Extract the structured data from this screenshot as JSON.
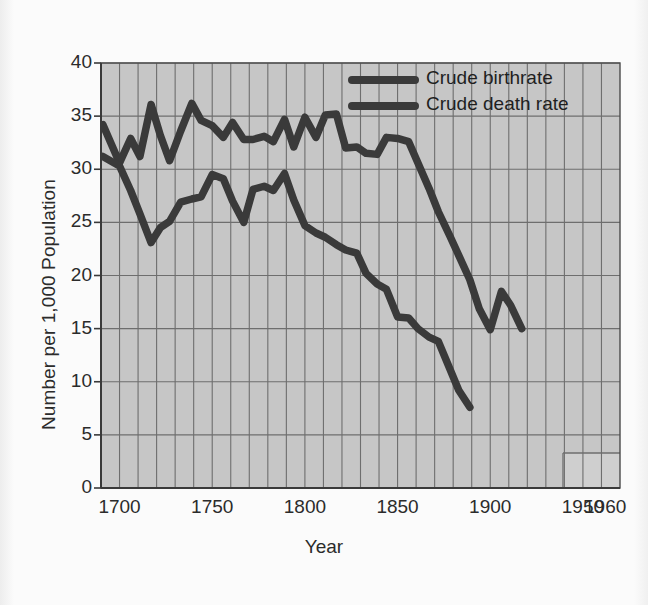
{
  "figure": {
    "background_color": "#fbfbfb",
    "plot_background_color": "#c6c6c6",
    "grid_color": "#6e6e6e",
    "line_color": "#3a3a3a"
  },
  "axes": {
    "y_title": "Number per 1,000 Population",
    "x_title": "Year",
    "y_ticks": [
      "40",
      "35",
      "30",
      "25",
      "20",
      "15",
      "10",
      "5",
      "0"
    ],
    "x_ticks": [
      "1700",
      "1750",
      "1800",
      "1850",
      "1900",
      "1950",
      "1960"
    ]
  },
  "legend": {
    "items": [
      {
        "label": "Crude birthrate",
        "color": "#3a3a3a"
      },
      {
        "label": "Crude death rate",
        "color": "#3a3a3a"
      }
    ]
  },
  "chart_data": {
    "type": "line",
    "title": "",
    "xlabel": "Year",
    "ylabel": "Number per 1,000 Population",
    "xlim": [
      1690,
      1970
    ],
    "ylim": [
      0,
      40
    ],
    "grid": true,
    "legend_position": "top-right",
    "series": [
      {
        "name": "Crude birthrate",
        "color": "#3a3a3a",
        "points": [
          [
            1691,
            34.2
          ],
          [
            1700,
            30.6
          ],
          [
            1706,
            32.9
          ],
          [
            1711,
            31.2
          ],
          [
            1717,
            36.1
          ],
          [
            1722,
            33.2
          ],
          [
            1727,
            30.8
          ],
          [
            1733,
            33.6
          ],
          [
            1739,
            36.2
          ],
          [
            1744,
            34.6
          ],
          [
            1750,
            34.1
          ],
          [
            1756,
            33.0
          ],
          [
            1761,
            34.4
          ],
          [
            1767,
            32.8
          ],
          [
            1772,
            32.8
          ],
          [
            1778,
            33.1
          ],
          [
            1783,
            32.6
          ],
          [
            1789,
            34.7
          ],
          [
            1794,
            32.1
          ],
          [
            1800,
            34.9
          ],
          [
            1806,
            33.0
          ],
          [
            1811,
            35.1
          ],
          [
            1817,
            35.2
          ],
          [
            1822,
            32.0
          ],
          [
            1828,
            32.1
          ],
          [
            1833,
            31.5
          ],
          [
            1839,
            31.4
          ],
          [
            1844,
            33.0
          ],
          [
            1850,
            32.9
          ],
          [
            1856,
            32.6
          ],
          [
            1861,
            30.6
          ],
          [
            1867,
            28.2
          ],
          [
            1872,
            26.0
          ],
          [
            1878,
            23.8
          ],
          [
            1883,
            21.9
          ],
          [
            1889,
            19.6
          ],
          [
            1894,
            16.9
          ],
          [
            1900,
            14.9
          ],
          [
            1906,
            18.5
          ],
          [
            1911,
            17.2
          ],
          [
            1917,
            15.0
          ]
        ]
      },
      {
        "name": "Crude death rate",
        "color": "#3a3a3a",
        "points": [
          [
            1691,
            31.2
          ],
          [
            1700,
            30.3
          ],
          [
            1706,
            28.0
          ],
          [
            1711,
            25.8
          ],
          [
            1717,
            23.1
          ],
          [
            1722,
            24.5
          ],
          [
            1727,
            25.1
          ],
          [
            1733,
            26.9
          ],
          [
            1739,
            27.2
          ],
          [
            1744,
            27.4
          ],
          [
            1750,
            29.5
          ],
          [
            1756,
            29.1
          ],
          [
            1761,
            27.0
          ],
          [
            1767,
            25.0
          ],
          [
            1772,
            28.1
          ],
          [
            1778,
            28.4
          ],
          [
            1783,
            28.0
          ],
          [
            1789,
            29.6
          ],
          [
            1794,
            27.1
          ],
          [
            1800,
            24.7
          ],
          [
            1806,
            24.0
          ],
          [
            1811,
            23.6
          ],
          [
            1817,
            22.9
          ],
          [
            1822,
            22.4
          ],
          [
            1828,
            22.1
          ],
          [
            1833,
            20.2
          ],
          [
            1839,
            19.2
          ],
          [
            1844,
            18.7
          ],
          [
            1850,
            16.1
          ],
          [
            1856,
            16.0
          ],
          [
            1861,
            15.0
          ],
          [
            1867,
            14.2
          ],
          [
            1872,
            13.8
          ],
          [
            1878,
            11.3
          ],
          [
            1883,
            9.2
          ],
          [
            1889,
            7.6
          ]
        ]
      }
    ]
  }
}
